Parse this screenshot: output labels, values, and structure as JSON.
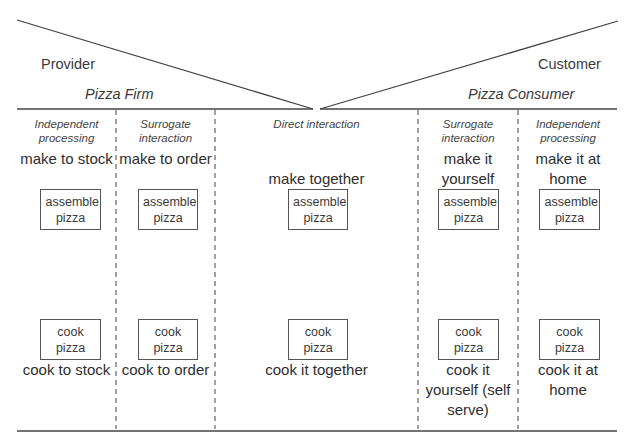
{
  "header": {
    "left_role": "Provider",
    "right_role": "Customer",
    "left_party": "Pizza Firm",
    "right_party": "Pizza Consumer"
  },
  "columns": [
    {
      "mode": "Independent processing",
      "make_label": "make to stock",
      "assemble_box": "assemble pizza",
      "cook_box": "cook pizza",
      "cook_label": "cook to stock"
    },
    {
      "mode": "Surrogate interaction",
      "make_label": "make to order",
      "assemble_box": "assemble pizza",
      "cook_box": "cook pizza",
      "cook_label": "cook to order"
    },
    {
      "mode": "Direct interaction",
      "make_label": "make together",
      "assemble_box": "assemble pizza",
      "cook_box": "cook pizza",
      "cook_label": "cook it together"
    },
    {
      "mode": "Surrogate interaction",
      "make_label": "make it yourself",
      "assemble_box": "assemble pizza",
      "cook_box": "cook pizza",
      "cook_label": "cook it yourself (self serve)"
    },
    {
      "mode": "Independent processing",
      "make_label": "make it at home",
      "assemble_box": "assemble pizza",
      "cook_box": "cook pizza",
      "cook_label": "cook it at home"
    }
  ],
  "colors": {
    "line": "#555555",
    "text": "#333333",
    "background": "#ffffff"
  }
}
